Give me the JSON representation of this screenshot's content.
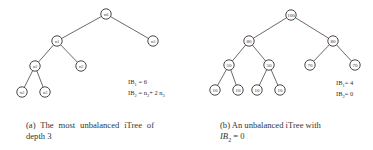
{
  "figure_a": {
    "nodes": [
      {
        "id": "root",
        "label": "n0",
        "x": 106,
        "y": 14
      },
      {
        "id": "l1",
        "label": "n1",
        "x": 57,
        "y": 41
      },
      {
        "id": "r1",
        "label": "n3",
        "x": 153,
        "y": 41
      },
      {
        "id": "l2",
        "label": "n2",
        "x": 35,
        "y": 66
      },
      {
        "id": "r2",
        "label": "n3",
        "x": 81,
        "y": 66
      },
      {
        "id": "l3",
        "label": "n3",
        "x": 22,
        "y": 92
      },
      {
        "id": "r3",
        "label": "n3",
        "x": 45,
        "y": 92
      }
    ],
    "edges": [
      [
        "root",
        "l1"
      ],
      [
        "root",
        "r1"
      ],
      [
        "l1",
        "l2"
      ],
      [
        "l1",
        "r2"
      ],
      [
        "l2",
        "l3"
      ],
      [
        "l2",
        "r3"
      ]
    ],
    "ib1": "IB",
    "ib1_sub": "1",
    "ib1_value": " = 6",
    "ib2": "IB",
    "ib2_sub": "2",
    "ib2_value": " = n",
    "ib2_sub_a": "2",
    "ib2_rest": "+ 2 n",
    "ib2_sub_b": "3",
    "caption": "(a) The most unbalanced iTree of depth 3"
  },
  "figure_b": {
    "nodes": [
      {
        "id": "root",
        "label": "100",
        "x": 291,
        "y": 15
      },
      {
        "id": "l1",
        "label": "80",
        "x": 249,
        "y": 41
      },
      {
        "id": "r1",
        "label": "80",
        "x": 333,
        "y": 41
      },
      {
        "id": "ll2",
        "label": "50",
        "x": 229,
        "y": 65
      },
      {
        "id": "lr2",
        "label": "50",
        "x": 269,
        "y": 65
      },
      {
        "id": "rl2",
        "label": "70",
        "x": 310,
        "y": 65
      },
      {
        "id": "rr2",
        "label": "70",
        "x": 355,
        "y": 65
      },
      {
        "id": "a3",
        "label": "10",
        "x": 215,
        "y": 90
      },
      {
        "id": "b3",
        "label": "10",
        "x": 238,
        "y": 90
      },
      {
        "id": "c3",
        "label": "10",
        "x": 257,
        "y": 90
      },
      {
        "id": "d3",
        "label": "10",
        "x": 280,
        "y": 90
      }
    ],
    "edges": [
      [
        "root",
        "l1"
      ],
      [
        "root",
        "r1"
      ],
      [
        "l1",
        "ll2"
      ],
      [
        "l1",
        "lr2"
      ],
      [
        "r1",
        "rl2"
      ],
      [
        "r1",
        "rr2"
      ],
      [
        "ll2",
        "a3"
      ],
      [
        "ll2",
        "b3"
      ],
      [
        "lr2",
        "c3"
      ],
      [
        "lr2",
        "d3"
      ]
    ],
    "ib1": "IB",
    "ib1_sub": "1",
    "ib1_value": "= 4",
    "ib2": "IB",
    "ib2_sub": "2",
    "ib2_value": "= 0",
    "caption_prefix": "(b) An unbalanced iTree with",
    "caption_math": "IB",
    "caption_math_sub": "2",
    "caption_math_rest": " = 0"
  }
}
